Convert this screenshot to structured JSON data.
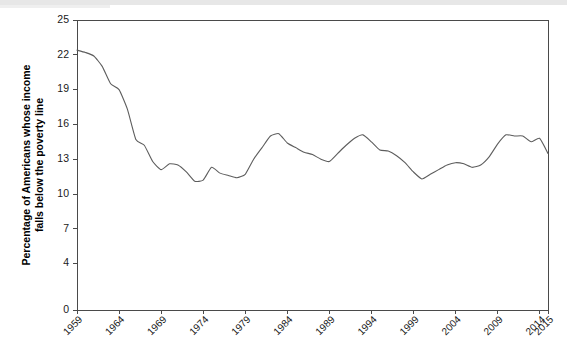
{
  "chart_data": {
    "type": "line",
    "title": "",
    "subtitle": "",
    "xlabel": "",
    "ylabel": "Percentage of Americans whose income falls below the poverty line",
    "ylabel_line1": "Percentage of Americans whose income",
    "ylabel_line2": "falls below the poverty line",
    "xlim": [
      1959,
      2015
    ],
    "ylim": [
      0,
      25
    ],
    "grid": false,
    "legend": false,
    "legend_position": "none",
    "line_color": "#5d5d5d",
    "axis_color": "#4a4a4a",
    "ytick_labels": [
      "25",
      "22",
      "19",
      "16",
      "13",
      "10",
      "7",
      "4",
      "0"
    ],
    "yticks": [
      25,
      22,
      19,
      16,
      13,
      10,
      7,
      4,
      0
    ],
    "xtick_labels": [
      "1959",
      "1964",
      "1969",
      "1974",
      "1979",
      "1984",
      "1989",
      "1994",
      "1999",
      "2004",
      "2009",
      "2014",
      "2015"
    ],
    "xticks": [
      1959,
      1964,
      1969,
      1974,
      1979,
      1984,
      1989,
      1994,
      1999,
      2004,
      2009,
      2014,
      2015
    ],
    "series": [
      {
        "name": "Poverty rate",
        "x": [
          1959,
          1960,
          1961,
          1962,
          1963,
          1964,
          1965,
          1966,
          1967,
          1968,
          1969,
          1970,
          1971,
          1972,
          1973,
          1974,
          1975,
          1976,
          1977,
          1978,
          1979,
          1980,
          1981,
          1982,
          1983,
          1984,
          1985,
          1986,
          1987,
          1988,
          1989,
          1990,
          1991,
          1992,
          1993,
          1994,
          1995,
          1996,
          1997,
          1998,
          1999,
          2000,
          2001,
          2002,
          2003,
          2004,
          2005,
          2006,
          2007,
          2008,
          2009,
          2010,
          2011,
          2012,
          2013,
          2014,
          2015
        ],
        "values": [
          22.4,
          22.2,
          21.9,
          21.0,
          19.5,
          19.0,
          17.3,
          14.7,
          14.2,
          12.8,
          12.1,
          12.6,
          12.5,
          11.9,
          11.1,
          11.2,
          12.3,
          11.8,
          11.6,
          11.4,
          11.7,
          13.0,
          14.0,
          15.0,
          15.2,
          14.4,
          14.0,
          13.6,
          13.4,
          13.0,
          12.8,
          13.5,
          14.2,
          14.8,
          15.1,
          14.5,
          13.8,
          13.7,
          13.3,
          12.7,
          11.9,
          11.3,
          11.7,
          12.1,
          12.5,
          12.7,
          12.6,
          12.3,
          12.5,
          13.2,
          14.3,
          15.1,
          15.0,
          15.0,
          14.5,
          14.8,
          13.5
        ]
      }
    ]
  },
  "plot_geometry": {
    "left": 77,
    "right": 548,
    "top": 20,
    "bottom": 310
  }
}
